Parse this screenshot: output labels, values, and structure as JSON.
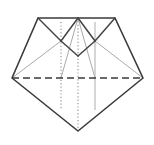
{
  "figure": {
    "name": "origami-crease-pattern-diamond",
    "canvas": {
      "width": 154,
      "height": 145
    },
    "background_color": "#ffffff"
  },
  "colors": {
    "outline": "#3a3a3a",
    "inner_solid": "#444444",
    "dashed": "#3a3a3a",
    "dotted": "#8c8c8c",
    "faint_gray": "#aaaaaa",
    "light_gray": "#b5b5b5"
  },
  "stroke_widths": {
    "outline": 1.6,
    "inner_solid": 1.5,
    "dashed": 1.5,
    "dotted": 1.1,
    "faint": 1.0
  },
  "dash_patterns": {
    "dashed": "7 4",
    "dotted": "1.2 2.2"
  },
  "points": {
    "top_left": {
      "x": 38,
      "y": 18
    },
    "top_right": {
      "x": 115,
      "y": 18
    },
    "left_vertex": {
      "x": 12,
      "y": 78
    },
    "right_vertex": {
      "x": 143,
      "y": 78
    },
    "bottom_apex": {
      "x": 78,
      "y": 131
    },
    "top_center": {
      "x": 78,
      "y": 18
    },
    "cross_left": {
      "x": 61,
      "y": 41
    },
    "cross_right": {
      "x": 95,
      "y": 41
    },
    "v_bottom": {
      "x": 78,
      "y": 56
    },
    "mid_left": {
      "x": 61,
      "y": 78
    },
    "mid_center": {
      "x": 78,
      "y": 78
    },
    "mid_right": {
      "x": 95,
      "y": 78
    }
  },
  "shapes": {
    "outline_path": "M 38 18 L 115 18 L 143 78 L 78 131 L 12 78 Z",
    "top_edge": {
      "x1": 38,
      "y1": 18,
      "x2": 115,
      "y2": 18
    },
    "left_upper_edge": {
      "x1": 38,
      "y1": 18,
      "x2": 12,
      "y2": 78
    },
    "right_upper_edge": {
      "x1": 115,
      "y1": 18,
      "x2": 143,
      "y2": 78
    },
    "left_lower_edge": {
      "x1": 12,
      "y1": 78,
      "x2": 78,
      "y2": 131
    },
    "right_lower_edge": {
      "x1": 143,
      "y1": 78,
      "x2": 78,
      "y2": 131
    }
  },
  "creases": {
    "solid_diagonals": [
      {
        "name": "top-left-to-cross-left",
        "x1": 38,
        "y1": 18,
        "x2": 61,
        "y2": 41
      },
      {
        "name": "cross-left-to-v-bottom",
        "x1": 61,
        "y1": 41,
        "x2": 78,
        "y2": 56
      },
      {
        "name": "v-bottom-to-cross-right",
        "x1": 78,
        "y1": 56,
        "x2": 95,
        "y2": 41
      },
      {
        "name": "cross-right-to-top-right",
        "x1": 95,
        "y1": 41,
        "x2": 115,
        "y2": 18
      },
      {
        "name": "top-center-to-cross-left",
        "x1": 78,
        "y1": 18,
        "x2": 61,
        "y2": 41
      },
      {
        "name": "top-center-to-cross-right",
        "x1": 78,
        "y1": 18,
        "x2": 95,
        "y2": 41
      }
    ],
    "faint_diagonals": [
      {
        "name": "left-vertex-to-cross-left",
        "x1": 12,
        "y1": 78,
        "x2": 61,
        "y2": 41
      },
      {
        "name": "right-vertex-to-cross-right",
        "x1": 143,
        "y1": 78,
        "x2": 95,
        "y2": 41
      },
      {
        "name": "mid-left-to-top-center",
        "x1": 61,
        "y1": 78,
        "x2": 78,
        "y2": 18
      },
      {
        "name": "mid-right-to-top-center",
        "x1": 95,
        "y1": 78,
        "x2": 78,
        "y2": 18
      }
    ],
    "dashed_horizontal": {
      "name": "middle-valley-fold",
      "x1": 12,
      "y1": 78,
      "x2": 143,
      "y2": 78
    },
    "vertical_creases": [
      {
        "name": "left-vertical-dotted",
        "x": 61,
        "y1": 22,
        "y2": 110,
        "style": "dotted"
      },
      {
        "name": "center-vertical-dotted",
        "x": 78,
        "y1": 18,
        "y2": 131,
        "style": "dotted"
      },
      {
        "name": "right-vertical-gray",
        "x": 95,
        "y1": 22,
        "y2": 110,
        "style": "solid-gray"
      }
    ]
  },
  "legend": {
    "solid_meaning": "cut or edge",
    "dashed_meaning": "valley fold",
    "dotted_meaning": "reference / guide line"
  }
}
